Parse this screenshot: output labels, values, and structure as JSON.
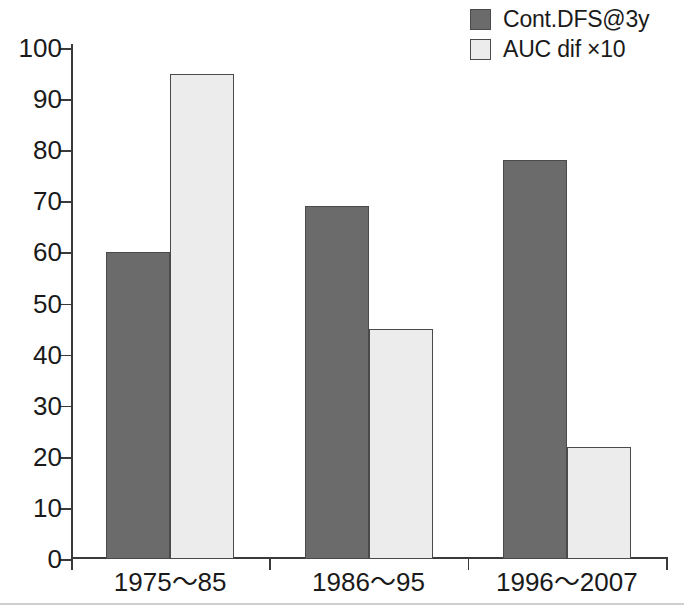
{
  "chart_data": {
    "type": "bar",
    "title": "",
    "subtitle": "",
    "xlabel": "",
    "ylabel": "",
    "ylim": [
      0,
      100
    ],
    "ytick_step": 10,
    "yticks": [
      0,
      10,
      20,
      30,
      40,
      50,
      60,
      70,
      80,
      90,
      100
    ],
    "ytick_labels": [
      "0",
      "10",
      "20",
      "30",
      "40",
      "50",
      "60",
      "70",
      "80",
      "90",
      "100"
    ],
    "grid": false,
    "legend_position": "top-right",
    "categories": [
      "1975〜85",
      "1986〜95",
      "1996〜2007"
    ],
    "series": [
      {
        "name": "Cont.DFS@3y",
        "values": [
          60,
          69,
          78
        ],
        "color": "#6b6b6b",
        "border_color": "#4a4a4a"
      },
      {
        "name": "AUC dif ×10",
        "values": [
          95,
          45,
          22
        ],
        "color": "#ececec",
        "border_color": "#4a4a4a"
      }
    ],
    "annotations": []
  },
  "colors": {
    "axis": "#3a3a3a",
    "text": "#1a1a1a",
    "background": "#ffffff",
    "series_dark": "#6b6b6b",
    "series_light": "#ececec",
    "bar_border": "#4a4a4a",
    "bottom_rule": "#cfcfcf"
  }
}
